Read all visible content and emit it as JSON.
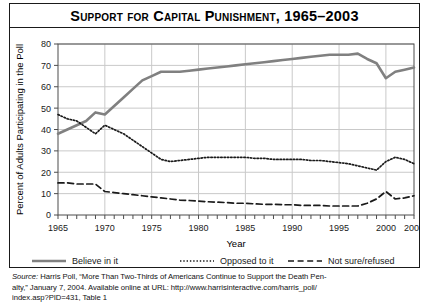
{
  "figure": {
    "title": "Support for Capital Punishment, 1965–2003"
  },
  "source": {
    "label": "Source:",
    "line1_rest": " Harris Poll, “More Than Two-Thirds of Americans Continue to Support the Death Pen-",
    "line2": "alty,” January 7, 2004. Available online at URL: http://www.harrisinteractive.com/harris_poll/",
    "line3": "index.asp?PID=431, Table 1"
  },
  "colors": {
    "believe_line": "#808080",
    "opposed_line": "#1a1a1a",
    "notsure_line": "#1a1a1a",
    "gridline": "#c9c9c9",
    "frame": "#4d4d4d",
    "border": "#1a1a1a",
    "text": "#000000"
  },
  "chart_data": {
    "type": "line",
    "title": "Support for Capital Punishment, 1965–2003",
    "xlabel": "Year",
    "ylabel": "Percent of Adults Participating in the Poll",
    "xlim": [
      1965,
      2003
    ],
    "ylim": [
      0,
      80
    ],
    "ytick_step": 10,
    "yticks": [
      0,
      10,
      20,
      30,
      40,
      50,
      60,
      70,
      80
    ],
    "xticks_labeled": [
      1965,
      1970,
      1975,
      1980,
      1985,
      1990,
      1995,
      2000,
      2003
    ],
    "xtick_minor_step": 1,
    "grid": "both",
    "legend_position": "below-axes",
    "x": [
      1965,
      1966,
      1967,
      1968,
      1969,
      1970,
      1971,
      1972,
      1973,
      1974,
      1975,
      1976,
      1977,
      1978,
      1979,
      1980,
      1981,
      1982,
      1983,
      1984,
      1985,
      1986,
      1987,
      1988,
      1989,
      1990,
      1991,
      1992,
      1993,
      1994,
      1995,
      1996,
      1997,
      1998,
      1999,
      2000,
      2001,
      2002,
      2003
    ],
    "series": [
      {
        "name": "Believe in it",
        "style": "solid",
        "color": "#808080",
        "width": 2.6,
        "values": [
          38,
          40,
          42,
          44,
          48,
          47,
          51,
          55,
          59,
          63,
          65,
          67,
          67,
          67,
          67.5,
          68,
          68.5,
          69,
          69.5,
          70,
          70.5,
          71,
          71.5,
          72,
          72.5,
          73,
          73.5,
          74,
          74.5,
          75,
          75,
          75,
          75.5,
          73,
          71,
          64,
          67,
          68,
          69
        ]
      },
      {
        "name": "Opposed to it",
        "style": "dotted",
        "color": "#1a1a1a",
        "width": 1.7,
        "values": [
          47,
          45,
          44,
          41,
          38,
          42,
          40,
          38,
          35,
          32,
          29,
          26,
          25,
          25.5,
          26,
          26.5,
          27,
          27,
          27,
          27,
          27,
          26.5,
          26.5,
          26,
          26,
          26,
          26,
          25.5,
          25.5,
          25,
          24.5,
          24,
          23,
          22,
          21,
          25,
          27,
          26,
          24
        ]
      },
      {
        "name": "Not sure/refused",
        "style": "dashed",
        "color": "#1a1a1a",
        "width": 1.7,
        "values": [
          15,
          15,
          14.5,
          14.5,
          14.5,
          11,
          10.5,
          10,
          9.5,
          9,
          8.5,
          8,
          7.5,
          7,
          6.8,
          6.5,
          6.2,
          6,
          5.8,
          5.5,
          5.5,
          5.2,
          5,
          5,
          4.8,
          4.8,
          4.5,
          4.5,
          4.5,
          4.2,
          4.2,
          4.2,
          4.2,
          5.5,
          7.5,
          11,
          7.5,
          8,
          9
        ]
      }
    ],
    "legend": [
      {
        "label": "Believe in it",
        "style": "solid",
        "color": "#808080"
      },
      {
        "label": "Opposed to it",
        "style": "dotted",
        "color": "#1a1a1a"
      },
      {
        "label": "Not sure/refused",
        "style": "dashed",
        "color": "#1a1a1a"
      }
    ]
  }
}
